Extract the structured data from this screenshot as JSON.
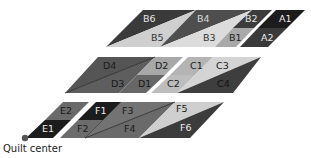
{
  "caption": "Quilt center",
  "colors": {
    "black": "#1e1e1e",
    "dark": "#3a3a3a",
    "medium": "#6e6e6e",
    "light": "#a8a8a8",
    "pale": "#d6d6d6",
    "white": "#ffffff"
  },
  "pieces": {
    "A1": "A1",
    "A2": "A2",
    "B1": "B1",
    "B2": "B2",
    "B3": "B3",
    "B4": "B4",
    "B5": "B5",
    "B6": "B6",
    "C1": "C1",
    "C2": "C2",
    "C3": "C3",
    "C4": "C4",
    "D1": "D1",
    "D2": "D2",
    "D3": "D3",
    "D4": "D4",
    "E1": "E1",
    "E2": "E2",
    "F1": "F1",
    "F2": "F2",
    "F3": "F3",
    "F4": "F4",
    "F5": "F5",
    "F6": "F6"
  }
}
